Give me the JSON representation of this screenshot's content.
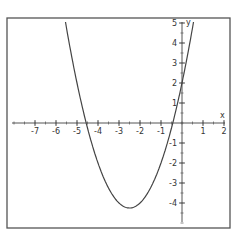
{
  "chart_data": {
    "type": "line",
    "title": "",
    "function": "y = x^2 + 5x + 2",
    "xlabel": "x",
    "ylabel": "y",
    "xlim": [
      -8,
      2.2
    ],
    "ylim": [
      -5,
      5.2
    ],
    "x_ticks": [
      -7,
      -6,
      -5,
      -4,
      -3,
      -2,
      -1,
      1,
      2
    ],
    "y_ticks": [
      5,
      4,
      3,
      2,
      1,
      -1,
      -2,
      -3,
      -4
    ],
    "grid": false,
    "legend": null,
    "series": [
      {
        "name": "parabola",
        "x": [
          -5.54,
          -5,
          -4.56,
          -4,
          -3.5,
          -3,
          -2.5,
          -2,
          -1.5,
          -1,
          -0.44,
          0,
          0.54
        ],
        "y": [
          5,
          2,
          0,
          -2,
          -3.25,
          -4,
          -4.25,
          -4,
          -3.25,
          -2,
          0,
          2,
          5
        ]
      }
    ],
    "key_points": {
      "vertex": [
        -2.5,
        -4.25
      ],
      "roots": [
        -4.56,
        -0.44
      ],
      "y_intercept": 2
    }
  },
  "labels": {
    "x_axis": "x",
    "y_axis": "y"
  }
}
